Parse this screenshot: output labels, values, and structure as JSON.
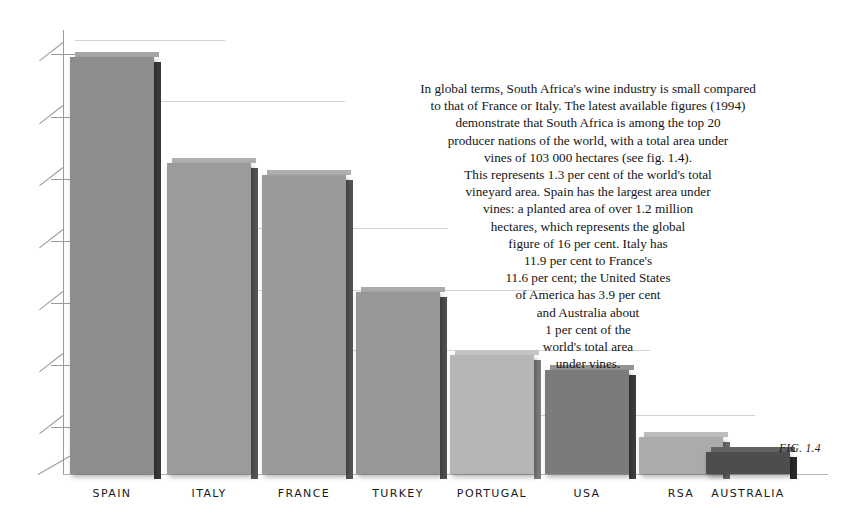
{
  "figure": {
    "caption": "FIG. 1.4"
  },
  "chart_data": {
    "type": "bar",
    "title": "",
    "subtitle": "",
    "xlabel": "",
    "ylabel": "",
    "categories": [
      "SPAIN",
      "ITALY",
      "FRANCE",
      "TURKEY",
      "PORTUGAL",
      "USA",
      "RSA",
      "AUSTRALIA"
    ],
    "values": [
      16.0,
      11.9,
      11.6,
      7.8,
      4.8,
      3.9,
      1.3,
      1.0
    ],
    "value_unit": "per cent of world total vineyard area",
    "ylim": [
      0,
      17.5
    ],
    "grid": true,
    "gridlines_y": [
      16.0,
      13.8,
      9.2,
      6.9,
      4.6,
      2.3
    ],
    "y_tick_count": 7,
    "y_tick_labels": [],
    "legend": "none",
    "bar_colors": [
      "#8d8d8d",
      "#9b9b9b",
      "#9a9a9a",
      "#979797",
      "#b6b6b6",
      "#7b7b7b",
      "#ababab",
      "#4d4d4d"
    ],
    "bar_side_colors": [
      "#3a3a3a",
      "#565656",
      "#555555",
      "#4f4f4f",
      "#7d7d7d",
      "#3e3e3e",
      "#6f6f6f",
      "#2a2a2a"
    ],
    "bar_top_colors": [
      "#a5a5a5",
      "#b0b0b0",
      "#afafaf",
      "#ababab",
      "#c6c6c6",
      "#949494",
      "#bdbdbd",
      "#636363"
    ],
    "bars": [
      {
        "label": "SPAIN",
        "value": 16.0,
        "x": 70,
        "width": 84,
        "top": 57,
        "height": 417
      },
      {
        "label": "ITALY",
        "value": 11.9,
        "x": 167,
        "width": 84,
        "top": 163,
        "height": 311
      },
      {
        "label": "FRANCE",
        "value": 11.6,
        "x": 262,
        "width": 84,
        "top": 175,
        "height": 299
      },
      {
        "label": "TURKEY",
        "value": 7.8,
        "x": 356,
        "width": 84,
        "top": 292,
        "height": 182
      },
      {
        "label": "PORTUGAL",
        "value": 4.8,
        "x": 450,
        "width": 84,
        "top": 355,
        "height": 119
      },
      {
        "label": "USA",
        "value": 3.9,
        "x": 545,
        "width": 84,
        "top": 370,
        "height": 104
      },
      {
        "label": "RSA",
        "value": 1.3,
        "x": 639,
        "width": 84,
        "top": 437,
        "height": 37
      },
      {
        "label": "AUSTRALIA",
        "value": 1.0,
        "x": 706,
        "width": 84,
        "top": 452,
        "height": 22
      }
    ],
    "annotation_text": "In global terms, South Africa's wine industry is small compared to that of France or Italy. The latest available figures (1994) demonstrate that South Africa is among the top 20 producer nations of the world, with a total area under vines of 103 000 hectares (see fig. 1.4). This represents 1.3 per cent of the world's total vineyard area. Spain has the largest area under vines: a planted area of over 1.2 million hectares, which represents the global figure of 16 per cent. Italy has 11.9 per cent to France's 11.6 per cent; the United States of America has 3.9 per cent and Australia about 1 per cent of the world's total area under vines."
  },
  "body_text": {
    "lines": [
      "In global terms, South Africa's wine industry is small compared",
      "to that of France or Italy. The latest available figures (1994)",
      "demonstrate that South Africa is among the top 20",
      "producer nations of the world, with a total area under",
      "vines of 103 000 hectares (see fig. 1.4).",
      "This represents 1.3 per cent of the world's total",
      "vineyard area.  Spain has the largest area under",
      "vines: a planted area of over 1.2 million",
      "hectares, which represents the global",
      "figure of 16 per cent.  Italy has",
      "11.9 per cent to France's",
      "11.6 per cent; the United States",
      "of America has 3.9 per cent",
      "and Australia about",
      "1 per cent of the",
      "world's total area",
      "under vines."
    ]
  },
  "axis": {
    "ticks": [
      {
        "y": 42
      },
      {
        "y": 105
      },
      {
        "y": 167
      },
      {
        "y": 229
      },
      {
        "y": 291
      },
      {
        "y": 353
      },
      {
        "y": 415
      }
    ],
    "gridlines": [
      {
        "y": 40,
        "x": 75,
        "width": 150
      },
      {
        "y": 101,
        "x": 80,
        "width": 265
      },
      {
        "y": 228,
        "x": 170,
        "width": 278
      },
      {
        "y": 290,
        "x": 255,
        "width": 295
      },
      {
        "y": 350,
        "x": 350,
        "width": 300
      },
      {
        "y": 415,
        "x": 450,
        "width": 305
      }
    ],
    "line_color": "#9a9a9a",
    "grid_color": "#d2d2d2"
  }
}
